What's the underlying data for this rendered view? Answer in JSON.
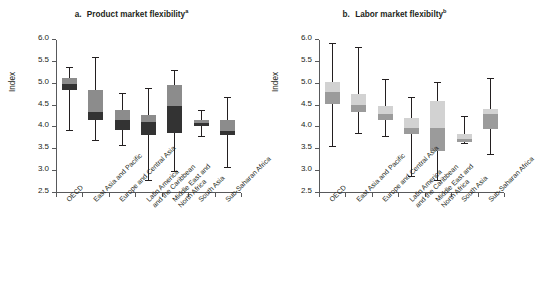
{
  "figure": {
    "ylabel": "Index",
    "yticks": [
      "2.5",
      "3.0",
      "3.5",
      "4.0",
      "4.5",
      "5.0",
      "5.5",
      "6.0"
    ],
    "ylim": [
      2.5,
      6.0
    ],
    "categories": [
      [
        "OECD"
      ],
      [
        "East Asia and Pacific"
      ],
      [
        "Europe and Central Asia"
      ],
      [
        "Latin America",
        "and the Caribbean"
      ],
      [
        "Middle East and",
        "North Africa"
      ],
      [
        "South Asia"
      ],
      [
        "Sub-Saharan Africa"
      ]
    ]
  },
  "panels": [
    {
      "key": "a",
      "title_prefix": "a.",
      "title": "Product market flexibility",
      "title_sup": "a",
      "color_upper": "#8c8c8c",
      "color_lower": "#333333"
    },
    {
      "key": "b",
      "title_prefix": "b.",
      "title": "Labor market flexibilty",
      "title_sup": "b",
      "color_upper": "#d2d2d2",
      "color_lower": "#9b9b9b"
    }
  ],
  "chart_data": [
    {
      "type": "box",
      "panel": "a",
      "title": "a. Product market flexibility",
      "xlabel": "",
      "ylabel": "Index",
      "ylim": [
        2.5,
        6.0
      ],
      "ytick_values": [
        2.5,
        3.0,
        3.5,
        4.0,
        4.5,
        5.0,
        5.5,
        6.0
      ],
      "grid": false,
      "legend": "none",
      "categories": [
        "OECD",
        "East Asia and Pacific",
        "Europe and Central Asia",
        "Latin America and the Caribbean",
        "Middle East and North Africa",
        "South Asia",
        "Sub-Saharan Africa"
      ],
      "boxes": [
        {
          "category": "OECD",
          "whisker_low": 3.92,
          "q1": 4.85,
          "median": 5.0,
          "q3": 5.12,
          "whisker_high": 5.35
        },
        {
          "category": "East Asia and Pacific",
          "whisker_low": 3.68,
          "q1": 4.18,
          "median": 4.35,
          "q3": 4.85,
          "whisker_high": 5.6
        },
        {
          "category": "Europe and Central Asia",
          "whisker_low": 3.57,
          "q1": 3.95,
          "median": 4.17,
          "q3": 4.41,
          "whisker_high": 4.76
        },
        {
          "category": "Latin America and the Caribbean",
          "whisker_low": 2.78,
          "q1": 3.82,
          "median": 4.12,
          "q3": 4.29,
          "whisker_high": 4.87
        },
        {
          "category": "Middle East and North Africa",
          "whisker_low": 2.98,
          "q1": 3.87,
          "median": 4.49,
          "q3": 4.98,
          "whisker_high": 5.3
        },
        {
          "category": "South Asia",
          "whisker_low": 3.78,
          "q1": 4.03,
          "median": 4.1,
          "q3": 4.17,
          "whisker_high": 4.38
        },
        {
          "category": "Sub-Saharan Africa",
          "whisker_low": 3.08,
          "q1": 3.82,
          "median": 3.92,
          "q3": 4.16,
          "whisker_high": 4.68
        }
      ]
    },
    {
      "type": "box",
      "panel": "b",
      "title": "b. Labor market flexibilty",
      "xlabel": "",
      "ylabel": "Index",
      "ylim": [
        2.5,
        6.0
      ],
      "ytick_values": [
        2.5,
        3.0,
        3.5,
        4.0,
        4.5,
        5.0,
        5.5,
        6.0
      ],
      "grid": false,
      "legend": "none",
      "categories": [
        "OECD",
        "East Asia and Pacific",
        "Europe and Central Asia",
        "Latin America and the Caribbean",
        "Middle East and North Africa",
        "South Asia",
        "Sub-Saharan Africa"
      ],
      "boxes": [
        {
          "category": "OECD",
          "whisker_low": 3.56,
          "q1": 4.54,
          "median": 4.8,
          "q3": 5.04,
          "whisker_high": 5.91
        },
        {
          "category": "East Asia and Pacific",
          "whisker_low": 3.85,
          "q1": 4.35,
          "median": 4.52,
          "q3": 4.76,
          "whisker_high": 5.81
        },
        {
          "category": "Europe and Central Asia",
          "whisker_low": 3.79,
          "q1": 4.17,
          "median": 4.31,
          "q3": 4.5,
          "whisker_high": 5.09
        },
        {
          "category": "Latin America and the Caribbean",
          "whisker_low": 2.87,
          "q1": 3.84,
          "median": 3.99,
          "q3": 4.22,
          "whisker_high": 4.67
        },
        {
          "category": "Middle East and North Africa",
          "whisker_low": 2.78,
          "q1": 3.45,
          "median": 3.99,
          "q3": 4.6,
          "whisker_high": 5.02
        },
        {
          "category": "South Asia",
          "whisker_low": 3.62,
          "q1": 3.67,
          "median": 3.73,
          "q3": 3.85,
          "whisker_high": 4.24
        },
        {
          "category": "Sub-Saharan Africa",
          "whisker_low": 3.38,
          "q1": 3.97,
          "median": 4.3,
          "q3": 4.43,
          "whisker_high": 5.1
        }
      ]
    }
  ]
}
